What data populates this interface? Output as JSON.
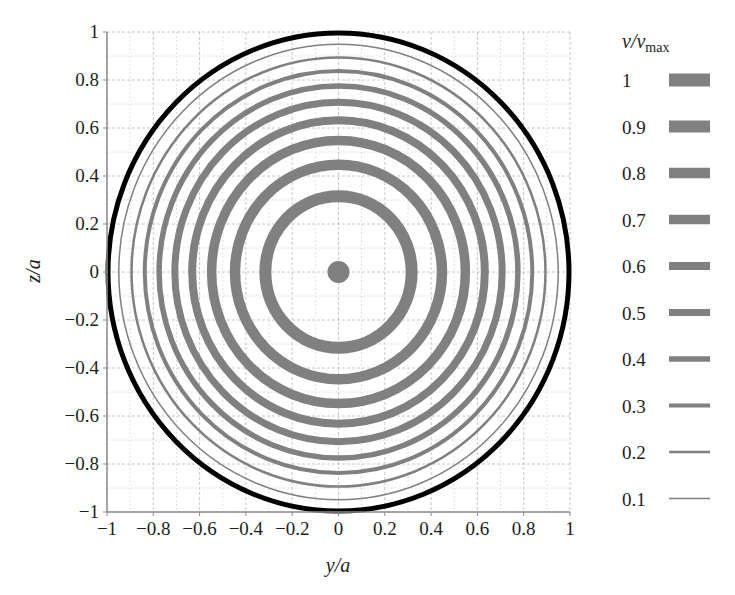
{
  "chart_data": {
    "type": "contour",
    "title": "",
    "xlabel": "y/a",
    "ylabel": "z/a",
    "xlim": [
      -1,
      1
    ],
    "ylim": [
      -1,
      1
    ],
    "grid": true,
    "xticks": [
      "−1",
      "−0.8",
      "−0.6",
      "−0.4",
      "−0.2",
      "0",
      "0.2",
      "0.4",
      "0.6",
      "0.8",
      "1"
    ],
    "yticks": [
      "1",
      "0.8",
      "0.6",
      "0.4",
      "0.2",
      "0",
      "−0.2",
      "−0.4",
      "−0.6",
      "−0.8",
      "−1"
    ],
    "legend": {
      "title": "v/v",
      "title_sub": "max",
      "position": "right",
      "entries": [
        {
          "label": "1",
          "value": 1.0,
          "width": 13
        },
        {
          "label": "0.9",
          "value": 0.9,
          "width": 12
        },
        {
          "label": "0.8",
          "value": 0.8,
          "width": 10.5
        },
        {
          "label": "0.7",
          "value": 0.7,
          "width": 9.5
        },
        {
          "label": "0.6",
          "value": 0.6,
          "width": 8
        },
        {
          "label": "0.5",
          "value": 0.5,
          "width": 7
        },
        {
          "label": "0.4",
          "value": 0.4,
          "width": 5.5
        },
        {
          "label": "0.3",
          "value": 0.3,
          "width": 4
        },
        {
          "label": "0.2",
          "value": 0.2,
          "width": 2.5
        },
        {
          "label": "0.1",
          "value": 0.1,
          "width": 1.5
        }
      ]
    },
    "contours": [
      {
        "v": 1.0,
        "r": 0.0,
        "stroke_width": 13
      },
      {
        "v": 0.9,
        "r": 0.316,
        "stroke_width": 12
      },
      {
        "v": 0.8,
        "r": 0.447,
        "stroke_width": 10.5
      },
      {
        "v": 0.7,
        "r": 0.548,
        "stroke_width": 9.5
      },
      {
        "v": 0.6,
        "r": 0.632,
        "stroke_width": 8
      },
      {
        "v": 0.5,
        "r": 0.707,
        "stroke_width": 7
      },
      {
        "v": 0.4,
        "r": 0.775,
        "stroke_width": 5.5
      },
      {
        "v": 0.3,
        "r": 0.837,
        "stroke_width": 4
      },
      {
        "v": 0.2,
        "r": 0.894,
        "stroke_width": 2.5
      },
      {
        "v": 0.1,
        "r": 0.949,
        "stroke_width": 1.5
      }
    ],
    "boundary": {
      "v": 0.0,
      "r": 1.0,
      "stroke_width": 5,
      "color": "#000000"
    },
    "colors": {
      "contour": "#808080",
      "boundary": "#000000",
      "grid_major": "#c8c8c8",
      "grid_minor": "#e0e0e0",
      "axis": "#8c8c8c"
    }
  }
}
